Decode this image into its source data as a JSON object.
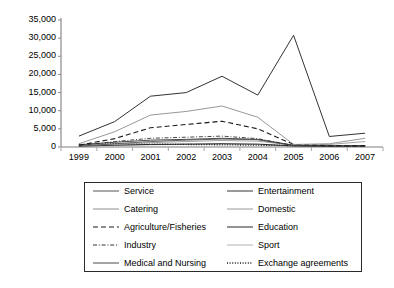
{
  "chart_data": {
    "type": "line",
    "title": "",
    "xlabel": "",
    "ylabel": "",
    "x": [
      "1999",
      "2000",
      "2001",
      "2002",
      "2003",
      "2004",
      "2005",
      "2006",
      "2007"
    ],
    "ylim": [
      0,
      35000
    ],
    "ytick_values": [
      0,
      5000,
      10000,
      15000,
      20000,
      25000,
      30000,
      35000
    ],
    "ytick_labels": [
      "0",
      "5,000",
      "10,000",
      "15,000",
      "20,000",
      "25,000",
      "30,000",
      "35,000"
    ],
    "grid": false,
    "legend_position": "below",
    "series": [
      {
        "name": "Service",
        "style": "solid",
        "color": "#555555",
        "width": 0.9,
        "values": [
          200,
          900,
          1500,
          1900,
          2200,
          2000,
          400,
          250,
          300
        ]
      },
      {
        "name": "Entertainment",
        "style": "solid",
        "color": "#333333",
        "width": 1.0,
        "values": [
          3000,
          7000,
          14000,
          15000,
          19500,
          14300,
          30800,
          2900,
          3800
        ]
      },
      {
        "name": "Catering",
        "style": "solid",
        "color": "#8c8c8c",
        "width": 0.9,
        "values": [
          900,
          4200,
          8800,
          9800,
          11300,
          8200,
          700,
          900,
          2400
        ]
      },
      {
        "name": "Domestic",
        "style": "solid",
        "color": "#999999",
        "width": 0.9,
        "values": [
          300,
          800,
          1200,
          1500,
          1800,
          1600,
          500,
          700,
          1500
        ]
      },
      {
        "name": "Agriculture/Fisheries",
        "style": "dashed",
        "color": "#1a1a1a",
        "width": 1.1,
        "values": [
          500,
          2300,
          5300,
          6200,
          7100,
          5000,
          700,
          350,
          300
        ]
      },
      {
        "name": "Education",
        "style": "solid",
        "color": "#2b2b2b",
        "width": 1.0,
        "values": [
          250,
          500,
          700,
          800,
          900,
          800,
          300,
          200,
          250
        ]
      },
      {
        "name": "Industry",
        "style": "dashdot",
        "color": "#333333",
        "width": 0.9,
        "values": [
          400,
          1500,
          2400,
          2700,
          3000,
          2300,
          400,
          300,
          350
        ]
      },
      {
        "name": "Sport",
        "style": "solid",
        "color": "#b0b0b0",
        "width": 0.8,
        "values": [
          150,
          400,
          600,
          700,
          800,
          650,
          250,
          200,
          250
        ]
      },
      {
        "name": "Medical and Nursing",
        "style": "solid",
        "color": "#4a4a4a",
        "width": 1.0,
        "values": [
          600,
          1300,
          1900,
          2100,
          2400,
          2100,
          500,
          300,
          400
        ]
      },
      {
        "name": "Exchange agreements",
        "style": "dotted",
        "color": "#1a1a1a",
        "width": 1.3,
        "values": [
          700,
          900,
          800,
          700,
          600,
          500,
          400,
          350,
          300
        ]
      }
    ]
  },
  "legend": {
    "items": [
      {
        "label": "Service"
      },
      {
        "label": "Entertainment"
      },
      {
        "label": "Catering"
      },
      {
        "label": "Domestic"
      },
      {
        "label": "Agriculture/Fisheries"
      },
      {
        "label": "Education"
      },
      {
        "label": "Industry"
      },
      {
        "label": "Sport"
      },
      {
        "label": "Medical and Nursing"
      },
      {
        "label": "Exchange agreements"
      }
    ]
  }
}
